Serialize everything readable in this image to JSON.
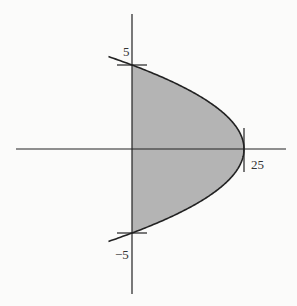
{
  "chart_data": {
    "type": "area",
    "title": "",
    "xlabel": "",
    "ylabel": "",
    "curve": "x = 25 - y^2",
    "series": [
      {
        "name": "x = 25 - y^2",
        "shaded_region": "between y-axis and curve for -5 <= y <= 5"
      }
    ],
    "points": [
      {
        "y": 5,
        "x": 0
      },
      {
        "y": 0,
        "x": 25
      },
      {
        "y": -5,
        "x": 0
      }
    ],
    "tick_labels": {
      "x": [
        "25"
      ],
      "y": [
        "5",
        "−5"
      ]
    },
    "xlim": [
      -29,
      34
    ],
    "ylim": [
      -8.5,
      8.5
    ],
    "grid": false,
    "fill_color": "#b4b4b4",
    "line_color": "#222222"
  },
  "labels": {
    "y_top": "5",
    "y_bottom": "−5",
    "x_right": "25"
  }
}
